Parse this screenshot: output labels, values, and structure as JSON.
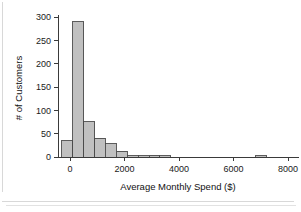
{
  "chart_data": {
    "type": "bar",
    "title": "",
    "xlabel": "Average Monthly Spend ($)",
    "ylabel": "# of Customers",
    "xlim": [
      -400,
      8400
    ],
    "ylim": [
      0,
      310
    ],
    "grid": false,
    "legend": null,
    "bin_width": 400,
    "bin_starts": [
      -300,
      100,
      500,
      900,
      1300,
      1700,
      2100,
      2500,
      2900,
      3300,
      6800
    ],
    "categories": [
      "-300",
      "100",
      "500",
      "900",
      "1300",
      "1700",
      "2100",
      "2500",
      "2900",
      "3300",
      "6800"
    ],
    "values": [
      35,
      290,
      76,
      40,
      28,
      12,
      3,
      2,
      4,
      2,
      3
    ],
    "xticks": [
      0,
      2000,
      4000,
      6000,
      8000
    ],
    "xtick_labels": [
      "0",
      "2000",
      "4000",
      "6000",
      "8000"
    ],
    "yticks": [
      0,
      50,
      100,
      150,
      200,
      250,
      300
    ],
    "ytick_labels": [
      "0",
      "50",
      "100",
      "150",
      "200",
      "250",
      "300"
    ],
    "bar_fill_color": "#c0c0c0",
    "bar_edge_color": "#4a4a4a",
    "axis_color": "#3a3a3a"
  }
}
